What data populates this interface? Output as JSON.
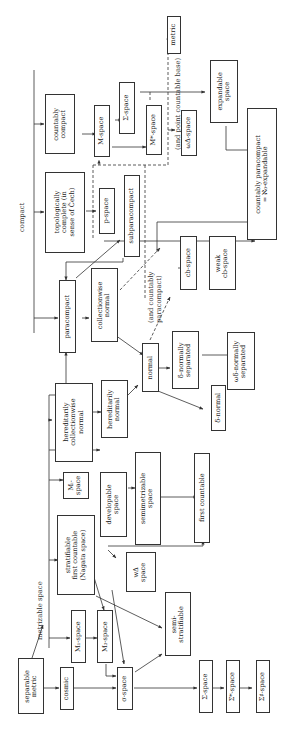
{
  "diagram": {
    "orientation": "rotated-90-ccw",
    "group_labels": {
      "compact": "compact",
      "metrizable_space": "metrizable space",
      "and_point_countable_base": "(and point countable base)",
      "and_countably_paracompact": "(and countably\nparacompact)"
    },
    "nodes": {
      "separable_metric": "separable\nmetric",
      "cosmic": "cosmic",
      "sigma_space": "σ-space",
      "Sigma_space_bottom": "Σ-space",
      "Sigma_star_space": "Σ*-space",
      "Sigma_sharp_space": "Σ♯-space",
      "M1_space": "M₁-space",
      "M3_space": "M₃-space",
      "semi_stratifiable": "semi-\nstratifiable",
      "stratifiable_first_countable": "stratifiable\nfirst countable\n(Nagata space)",
      "w_delta_space": "wΔ\nspace",
      "Mi_space": "Mᵢ-\nspace",
      "developable_space": "developable\nspace",
      "semimetrizable_space": "semimetrizable\nspace",
      "first_countable": "first countable",
      "hereditarily_collectionwise_normal": "hereditarily\ncollectionwise\nnormal",
      "hereditarily_normal": "hereditarily\nnormal",
      "normal": "normal",
      "delta_normal": "δ-normal",
      "delta_normally_separated": "δ-normally\nseparated",
      "w_delta_normally_separated": "ωδ-normally\nseparated",
      "paracompact": "paracompact",
      "collectionwise_normal": "collectionwise\nnormal",
      "cb_space": "cb-space",
      "weak_cb_space": "weak\ncb-space",
      "topologically_complete": "topologically\ncomplete (in\nsense of Čech)",
      "p_space": "p-space",
      "subparacompact": "subparacompact",
      "countably_compact": "countably\ncompact",
      "M_space": "M-space",
      "Sigma_space_top": "Σ-space",
      "M_star_space": "M*-space",
      "w_Delta_space": "ωΔ-space",
      "metric": "metric",
      "expandable_space": "expandable\nspace",
      "countably_paracompact_aleph0_expandable": "countably paracompact\n= ℵ₀-expandable"
    }
  }
}
